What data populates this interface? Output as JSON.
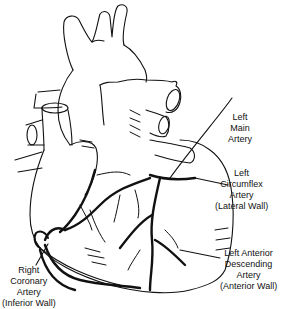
{
  "figure": {
    "labels": [
      {
        "id": "left-main",
        "lines": [
          "Left",
          "Main",
          "Artery"
        ]
      },
      {
        "id": "left-circumflex",
        "lines": [
          "Left",
          "Circumflex",
          "Artery",
          "(Lateral Wall)"
        ]
      },
      {
        "id": "lad",
        "lines": [
          "Left Anterior",
          "Descending",
          "Artery",
          "(Anterior Wall)"
        ]
      },
      {
        "id": "rca",
        "lines": [
          "Right",
          "Coronary",
          "Artery",
          "(Inferior Wall)"
        ]
      }
    ]
  }
}
